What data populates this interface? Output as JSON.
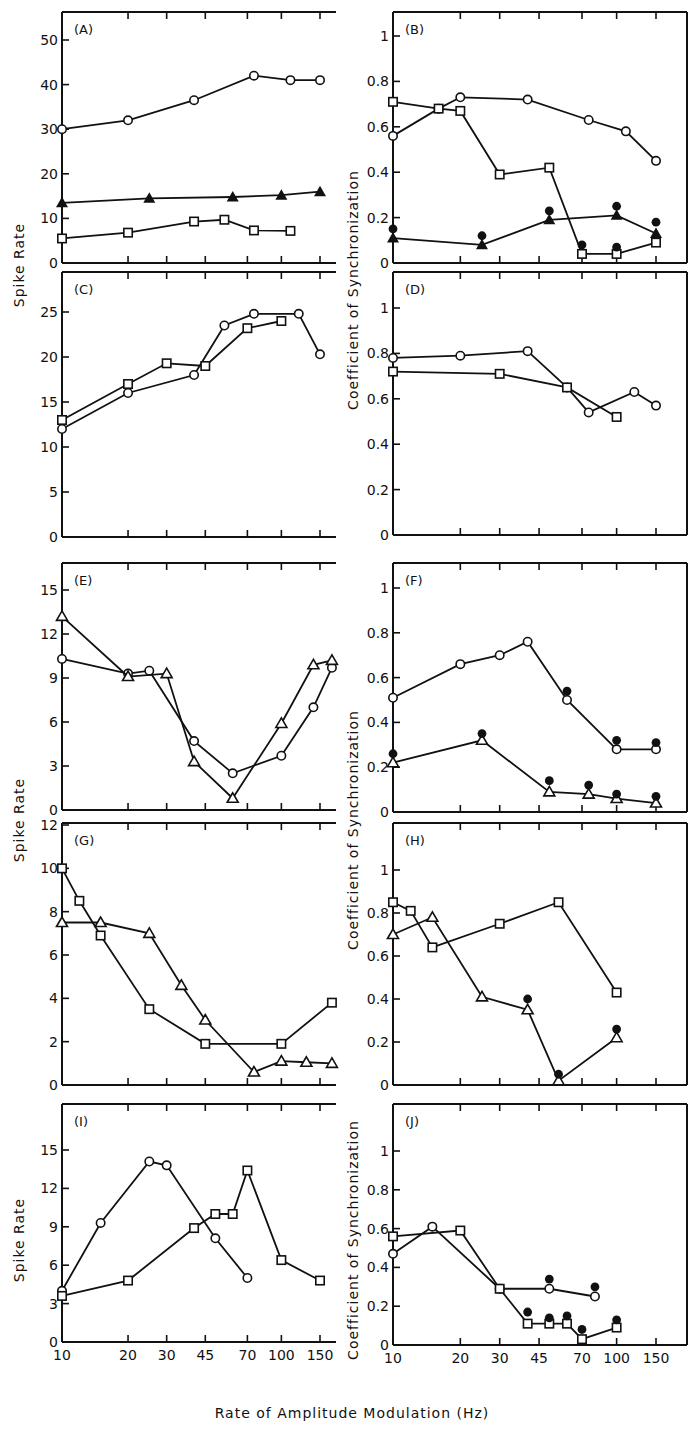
{
  "figure": {
    "xlabel": "Rate of Amplitude Modulation (Hz)",
    "ylabel_left": "Spike Rate",
    "ylabel_right": "Coefficient of Synchronization",
    "x_ticks": [
      10,
      20,
      30,
      45,
      70,
      100,
      150
    ],
    "x_scale": "log"
  },
  "chart_data": [
    {
      "panel": "(A)",
      "type": "line",
      "ylabel": "Spike Rate",
      "yticks": [
        0,
        10,
        20,
        30,
        40,
        50
      ],
      "ylim": [
        0,
        55
      ],
      "series": [
        {
          "marker": "open-circle",
          "x": [
            10,
            20,
            40,
            75,
            110,
            150
          ],
          "y": [
            30,
            32,
            36.5,
            42,
            41,
            41
          ]
        },
        {
          "marker": "filled-triangle",
          "x": [
            10,
            25,
            60,
            100,
            150
          ],
          "y": [
            13.5,
            14.5,
            14.8,
            15.2,
            16
          ]
        },
        {
          "marker": "open-square",
          "x": [
            10,
            20,
            40,
            55,
            75,
            110
          ],
          "y": [
            5.5,
            6.8,
            9.3,
            9.7,
            7.3,
            7.2
          ]
        }
      ]
    },
    {
      "panel": "(B)",
      "type": "line",
      "ylabel": "Coefficient of Synchronization",
      "yticks": [
        0,
        0.2,
        0.4,
        0.6,
        0.8,
        1.0
      ],
      "ylim": [
        0,
        1.1
      ],
      "series": [
        {
          "marker": "open-circle",
          "x": [
            10,
            16,
            20,
            40,
            75,
            110,
            150
          ],
          "y": [
            0.56,
            0.68,
            0.73,
            0.72,
            0.63,
            0.58,
            0.45
          ]
        },
        {
          "marker": "open-square",
          "x": [
            10,
            16,
            20,
            30,
            50,
            70,
            100,
            150
          ],
          "y": [
            0.71,
            0.68,
            0.67,
            0.39,
            0.42,
            0.04,
            0.04,
            0.09
          ]
        },
        {
          "marker": "filled-triangle",
          "x": [
            10,
            25,
            50,
            100,
            150
          ],
          "y": [
            0.11,
            0.08,
            0.19,
            0.21,
            0.13
          ]
        },
        {
          "marker": "filled-circle",
          "x": [
            10,
            25,
            50,
            70,
            100,
            150
          ],
          "y": [
            0.15,
            0.12,
            0.23,
            0.08,
            0.25,
            0.18
          ]
        },
        {
          "marker": "filled-circle-isolated",
          "x": [
            100
          ],
          "y": [
            0.07
          ]
        }
      ]
    },
    {
      "panel": "(C)",
      "type": "line",
      "ylabel": "Spike Rate",
      "yticks": [
        0,
        5,
        10,
        15,
        20,
        25
      ],
      "ylim": [
        0,
        28
      ],
      "series": [
        {
          "marker": "open-circle",
          "x": [
            10,
            20,
            40,
            55,
            75,
            120,
            150
          ],
          "y": [
            12,
            16,
            18,
            23.5,
            24.8,
            24.8,
            20.3
          ]
        },
        {
          "marker": "open-square",
          "x": [
            10,
            20,
            30,
            45,
            70,
            100
          ],
          "y": [
            13,
            17,
            19.3,
            19,
            23.2,
            24
          ]
        }
      ]
    },
    {
      "panel": "(D)",
      "type": "line",
      "ylabel": "Coefficient of Synchronization",
      "yticks": [
        0,
        0.2,
        0.4,
        0.6,
        0.8,
        1.0
      ],
      "ylim": [
        0,
        1.15
      ],
      "series": [
        {
          "marker": "open-circle",
          "x": [
            10,
            20,
            40,
            60,
            75,
            120,
            150
          ],
          "y": [
            0.78,
            0.79,
            0.81,
            0.65,
            0.54,
            0.63,
            0.57
          ]
        },
        {
          "marker": "open-square",
          "x": [
            10,
            30,
            60,
            100
          ],
          "y": [
            0.72,
            0.71,
            0.65,
            0.52
          ]
        }
      ]
    },
    {
      "panel": "(E)",
      "type": "line",
      "ylabel": "Spike Rate",
      "yticks": [
        0,
        3,
        6,
        9,
        12,
        15
      ],
      "ylim": [
        0,
        17.5
      ],
      "series": [
        {
          "marker": "open-circle",
          "x": [
            10,
            20,
            25,
            40,
            60,
            100,
            140,
            170
          ],
          "y": [
            10.3,
            9.3,
            9.5,
            4.7,
            2.5,
            3.7,
            7,
            9.7
          ]
        },
        {
          "marker": "open-triangle",
          "x": [
            10,
            20,
            30,
            40,
            60,
            100,
            140,
            170
          ],
          "y": [
            13.2,
            9.1,
            9.3,
            3.3,
            0.8,
            5.9,
            9.9,
            10.2
          ]
        }
      ]
    },
    {
      "panel": "(F)",
      "type": "line",
      "ylabel": "Coefficient of Synchronization",
      "yticks": [
        0,
        0.2,
        0.4,
        0.6,
        0.8,
        1.0
      ],
      "ylim": [
        0,
        1.15
      ],
      "series": [
        {
          "marker": "open-circle",
          "x": [
            10,
            20,
            30,
            40,
            60,
            100,
            150
          ],
          "y": [
            0.51,
            0.66,
            0.7,
            0.76,
            0.5,
            0.28,
            0.28
          ]
        },
        {
          "marker": "open-triangle",
          "x": [
            10,
            25,
            50,
            75,
            100,
            150
          ],
          "y": [
            0.22,
            0.32,
            0.09,
            0.08,
            0.06,
            0.04
          ]
        },
        {
          "marker": "filled-circle",
          "x": [
            10,
            25,
            50,
            60,
            75,
            100,
            150
          ],
          "y": [
            0.26,
            0.35,
            0.14,
            0.54,
            0.12,
            0.32,
            0.31
          ]
        },
        {
          "marker": "filled-circle-low",
          "x": [
            100,
            150
          ],
          "y": [
            0.08,
            0.07
          ]
        }
      ]
    },
    {
      "panel": "(G)",
      "type": "line",
      "ylabel": "Spike Rate",
      "yticks": [
        0,
        2,
        4,
        6,
        8,
        10,
        12
      ],
      "ylim": [
        0,
        12
      ],
      "series": [
        {
          "marker": "open-square",
          "x": [
            10,
            12,
            15,
            25,
            45,
            100,
            170
          ],
          "y": [
            10,
            8.5,
            6.9,
            3.5,
            1.9,
            1.9,
            3.8
          ]
        },
        {
          "marker": "open-triangle",
          "x": [
            10,
            15,
            25,
            35,
            45,
            75,
            100,
            130,
            170
          ],
          "y": [
            7.5,
            7.5,
            7,
            4.6,
            3,
            0.6,
            1.1,
            1.05,
            1
          ]
        }
      ]
    },
    {
      "panel": "(H)",
      "type": "line",
      "ylabel": "Coefficient of Synchronization",
      "yticks": [
        0,
        0.2,
        0.4,
        0.6,
        0.8,
        1.0
      ],
      "ylim": [
        0,
        1.15
      ],
      "series": [
        {
          "marker": "open-square",
          "x": [
            10,
            12,
            15,
            30,
            55,
            100
          ],
          "y": [
            0.85,
            0.81,
            0.64,
            0.75,
            0.85,
            0.43
          ]
        },
        {
          "marker": "open-triangle",
          "x": [
            10,
            15,
            25,
            40,
            55,
            100
          ],
          "y": [
            0.7,
            0.78,
            0.41,
            0.35,
            0.02,
            0.22
          ]
        },
        {
          "marker": "filled-circle",
          "x": [
            40,
            55,
            100
          ],
          "y": [
            0.4,
            0.05,
            0.26
          ]
        }
      ]
    },
    {
      "panel": "(I)",
      "type": "line",
      "ylabel": "Spike Rate",
      "yticks": [
        0,
        3,
        6,
        9,
        12,
        15
      ],
      "ylim": [
        0,
        18
      ],
      "series": [
        {
          "marker": "open-circle",
          "x": [
            10,
            15,
            25,
            30,
            50,
            70
          ],
          "y": [
            4,
            9.3,
            14.1,
            13.8,
            8.1,
            5
          ]
        },
        {
          "marker": "open-square",
          "x": [
            10,
            20,
            40,
            50,
            60,
            70,
            100,
            150
          ],
          "y": [
            3.6,
            4.8,
            8.9,
            10,
            10,
            13.4,
            6.4,
            4.8
          ]
        }
      ]
    },
    {
      "panel": "(J)",
      "type": "line",
      "ylabel": "Coefficient of Synchronization",
      "yticks": [
        0,
        0.2,
        0.4,
        0.6,
        0.8,
        1.0
      ],
      "ylim": [
        0,
        1.15
      ],
      "series": [
        {
          "marker": "open-circle",
          "x": [
            10,
            15,
            30,
            50,
            80
          ],
          "y": [
            0.47,
            0.61,
            0.29,
            0.29,
            0.25
          ]
        },
        {
          "marker": "open-square",
          "x": [
            10,
            20,
            30,
            40,
            50,
            60,
            70,
            100
          ],
          "y": [
            0.56,
            0.59,
            0.29,
            0.11,
            0.11,
            0.11,
            0.03,
            0.09
          ]
        },
        {
          "marker": "filled-circle",
          "x": [
            40,
            50,
            50,
            60,
            70,
            80,
            100
          ],
          "y": [
            0.17,
            0.14,
            0.34,
            0.15,
            0.08,
            0.3,
            0.13
          ]
        }
      ]
    }
  ]
}
